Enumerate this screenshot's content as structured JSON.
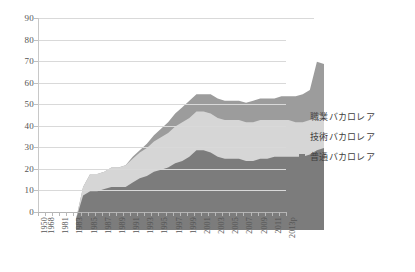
{
  "chart_data": {
    "type": "area",
    "stacked": true,
    "title": "",
    "subtitle": "",
    "xlabel": "",
    "ylabel": "",
    "ylim": [
      0,
      90
    ],
    "ytick_step": 10,
    "ytick_labels": [
      "0",
      "10",
      "20",
      "30",
      "40",
      "50",
      "60",
      "70",
      "80",
      "90"
    ],
    "grid": true,
    "legend_position": "right",
    "x_tick_labels": [
      "1950",
      "1968",
      "1981",
      "1983",
      "1985",
      "1987",
      "1989",
      "1991",
      "1993",
      "1995",
      "1997",
      "1999",
      "2001",
      "2003",
      "2005",
      "2007",
      "2009",
      "2011",
      "2013p"
    ],
    "x": [
      "1950",
      "1968",
      "1980",
      "1981",
      "1982",
      "1983",
      "1984",
      "1985",
      "1986",
      "1987",
      "1988",
      "1989",
      "1990",
      "1991",
      "1992",
      "1993",
      "1994",
      "1995",
      "1996",
      "1997",
      "1998",
      "1999",
      "2000",
      "2001",
      "2002",
      "2003",
      "2004",
      "2005",
      "2006",
      "2007",
      "2008",
      "2009",
      "2010",
      "2011",
      "2012",
      "2013p"
    ],
    "series": [
      {
        "name": "普通バカロレア",
        "color": "#7c7c7c",
        "values": [
          5,
          16,
          18,
          18,
          19,
          20,
          20,
          20,
          22,
          24,
          25,
          27,
          28,
          29,
          31,
          32,
          34,
          37,
          37,
          36,
          34,
          33,
          33,
          33,
          32,
          32,
          33,
          33,
          34,
          34,
          34,
          34,
          34,
          35,
          37,
          38
        ]
      },
      {
        "name": "技術バカロレア",
        "color": "#d6d6d6",
        "values": [
          0,
          4,
          8,
          8,
          8,
          9,
          9,
          10,
          11,
          12,
          13,
          14,
          15,
          16,
          17,
          18,
          18,
          18,
          18,
          18,
          18,
          18,
          18,
          18,
          18,
          18,
          18,
          18,
          17,
          17,
          17,
          16,
          16,
          16,
          16,
          16
        ]
      },
      {
        "name": "職業バカロレア",
        "color": "#9c9c9c",
        "values": [
          0,
          0,
          0,
          0,
          0,
          0,
          0,
          0,
          1,
          1,
          2,
          3,
          4,
          5,
          6,
          7,
          8,
          8,
          8,
          9,
          9,
          9,
          9,
          9,
          9,
          10,
          10,
          10,
          10,
          11,
          11,
          12,
          13,
          14,
          25,
          23
        ]
      }
    ],
    "legend": [
      {
        "label": "職業バカロレア",
        "color": "#9c9c9c"
      },
      {
        "label": "技術バカロレア",
        "color": "#d6d6d6"
      },
      {
        "label": "普通バカロレア",
        "color": "#7c7c7c"
      }
    ]
  }
}
